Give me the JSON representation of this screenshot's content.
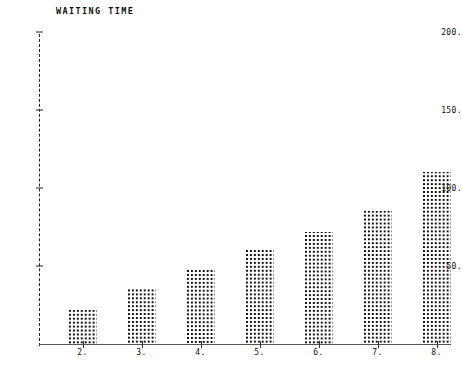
{
  "chart_data": {
    "type": "bar",
    "title": "WAITING TIME",
    "xlabel": "",
    "ylabel": "",
    "categories": [
      "2.",
      "3.",
      "4.",
      "5.",
      "6.",
      "7.",
      "8."
    ],
    "x": [
      2,
      3,
      4,
      5,
      6,
      7,
      8
    ],
    "values": [
      22,
      35,
      48,
      60,
      72,
      85,
      110
    ],
    "ylim": [
      0,
      210
    ],
    "xlim": [
      1.4,
      8.9
    ],
    "yticks": [
      50,
      100,
      150,
      200
    ],
    "ytick_labels": [
      "50.",
      "100.",
      "150.",
      "200."
    ],
    "xtick_labels": [
      "2.",
      "3.",
      "4.",
      "5.",
      "6.",
      "7.",
      "8."
    ],
    "grid": false,
    "legend": null,
    "marker_style": "dot-matrix-fill",
    "colors": {
      "bar_fill": "#111111",
      "axis": "#555555",
      "y_axis_dashed": "#222222",
      "text": "#111111",
      "background": "#ffffff"
    }
  }
}
